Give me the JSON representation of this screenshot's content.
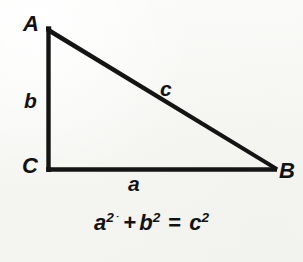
{
  "figure": {
    "name": "right-triangle-pythagorean-theorem",
    "background_color": "#f7f7f5",
    "ink_color": "#121212",
    "stroke_width_px": 4
  },
  "triangle": {
    "description": "Right triangle with right angle at vertex C",
    "vertices": [
      {
        "label": "A",
        "x": 47,
        "y": 28
      },
      {
        "label": "C",
        "x": 47,
        "y": 169
      },
      {
        "label": "B",
        "x": 276,
        "y": 169
      }
    ],
    "sides": [
      {
        "label": "a",
        "between": "C-B",
        "position": "bottom"
      },
      {
        "label": "b",
        "between": "A-C",
        "position": "left"
      },
      {
        "label": "c",
        "between": "A-B",
        "position": "hypotenuse"
      }
    ]
  },
  "labels": {
    "vertex_a": "A",
    "vertex_b": "B",
    "vertex_c": "C",
    "side_a": "a",
    "side_b": "b",
    "side_c": "c"
  },
  "equation": {
    "full_text": "a2 + b2 = c2",
    "display": "a² ˙+ b² = c²",
    "terms": {
      "term1_base": "a",
      "term1_exp": "2",
      "speck": "˙",
      "plus": "+",
      "term2_base": "b",
      "term2_exp": "2",
      "equals": "=",
      "term3_base": "c",
      "term3_exp": "2"
    }
  }
}
